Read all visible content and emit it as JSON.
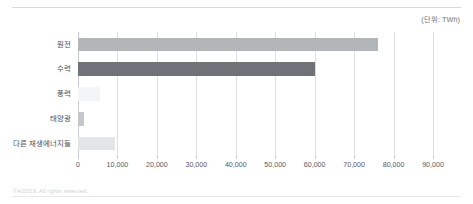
{
  "unit_caption": "(단위: TWh)",
  "footer": {
    "copyright": "©A/2019. All rights reserved."
  },
  "colors": {
    "bar_nuclear": "#b3b6b9",
    "bar_hydro": "#6f7276",
    "bar_wind": "#f4f5f6",
    "bar_solar": "#c4c7ca",
    "bar_other_renewables": "#e3e5e7",
    "gridline": "#dcdfe2",
    "axis_text": "#55595e",
    "label_text": "#4a4e53",
    "caption_text": "#6d7176",
    "footer_text": "#cdd0d3",
    "top_rule": "#d7dadd"
  },
  "chart_data": {
    "type": "bar",
    "orientation": "horizontal",
    "title": "",
    "subtitle": "",
    "xlabel": "",
    "ylabel": "",
    "unit": "TWh",
    "categories": [
      "원전",
      "수력",
      "풍력",
      "태양광",
      "다른 재생에너지들"
    ],
    "values": [
      76000,
      60000,
      5600,
      1500,
      9500
    ],
    "series": [
      {
        "name": "발전량",
        "values": [
          76000,
          60000,
          5600,
          1500,
          9500
        ]
      }
    ],
    "bar_colors": [
      "#b3b6b9",
      "#6f7276",
      "#f4f5f6",
      "#c4c7ca",
      "#e3e5e7"
    ],
    "xlim": [
      0,
      90000
    ],
    "xticks": [
      0,
      10000,
      20000,
      30000,
      40000,
      50000,
      60000,
      70000,
      80000,
      90000
    ],
    "xtick_labels": [
      "0",
      "10,000",
      "20,000",
      "30,000",
      "40,000",
      "50,000",
      "60,000",
      "70,000",
      "80,000",
      "90,000"
    ],
    "grid": true,
    "grid_axis": "x",
    "legend": false,
    "legend_position": "none",
    "annotations": [
      "(단위: TWh)"
    ]
  }
}
